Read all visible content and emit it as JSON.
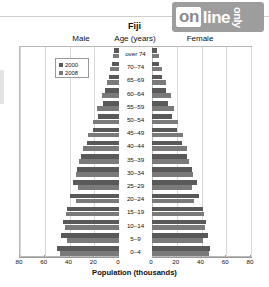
{
  "watermark": {
    "part1": "on",
    "part2": "line",
    "part3": "only"
  },
  "header": {
    "title": "Fiji",
    "male_label": "Male",
    "age_label": "Age (years)",
    "female_label": "Female"
  },
  "legend": {
    "series": [
      {
        "name": "2000",
        "color": "#595959"
      },
      {
        "name": "2008",
        "color": "#7a7a7a"
      }
    ]
  },
  "axis": {
    "xlabel": "Population (thousands)",
    "ticks": [
      "80",
      "60",
      "40",
      "20",
      "0",
      "0",
      "20",
      "40",
      "60",
      "80"
    ]
  },
  "chart_data": {
    "type": "bar",
    "subtype": "population-pyramid",
    "title": "Fiji",
    "xlabel": "Population (thousands)",
    "ylabel": "Age (years)",
    "xlim": [
      0,
      80
    ],
    "grid": true,
    "legend_position": "upper-left",
    "categories": [
      "over 74",
      "70–74",
      "65–69",
      "60–64",
      "55–59",
      "50–54",
      "45–49",
      "40–44",
      "35–39",
      "30–34",
      "25–29",
      "20–24",
      "15–19",
      "10–14",
      "5–9",
      "0–4"
    ],
    "sides": [
      "Male",
      "Female"
    ],
    "series": [
      {
        "name": "2000",
        "side": "Male",
        "values": [
          4,
          6,
          8,
          11,
          13,
          17,
          21,
          26,
          31,
          34,
          37,
          40,
          42,
          45,
          47,
          50
        ]
      },
      {
        "name": "2008",
        "side": "Male",
        "values": [
          5,
          7,
          10,
          14,
          18,
          21,
          25,
          29,
          32,
          35,
          33,
          35,
          43,
          44,
          42,
          48
        ]
      },
      {
        "name": "2000",
        "side": "Female",
        "values": [
          4,
          6,
          8,
          11,
          13,
          16,
          20,
          24,
          28,
          32,
          36,
          38,
          41,
          44,
          45,
          47
        ]
      },
      {
        "name": "2008",
        "side": "Female",
        "values": [
          6,
          8,
          11,
          15,
          18,
          21,
          25,
          28,
          30,
          33,
          32,
          34,
          42,
          43,
          41,
          46
        ]
      }
    ]
  }
}
